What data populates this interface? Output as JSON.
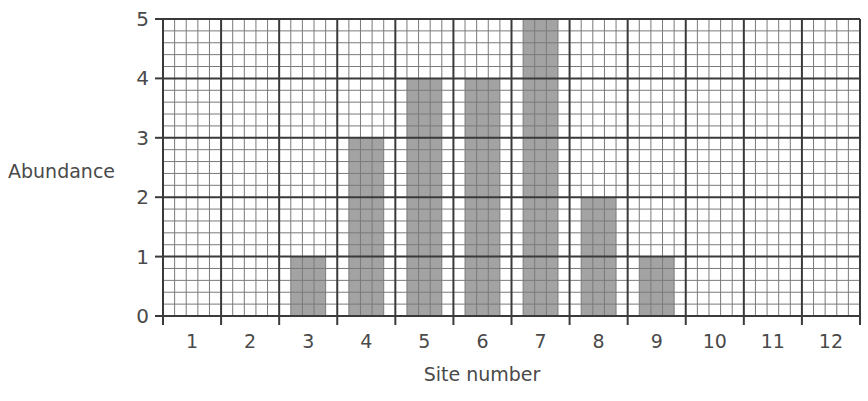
{
  "chart_data": {
    "type": "bar",
    "title": "",
    "xlabel": "Site number",
    "ylabel": "Abundance",
    "categories": [
      "1",
      "2",
      "3",
      "4",
      "5",
      "6",
      "7",
      "8",
      "9",
      "10",
      "11",
      "12"
    ],
    "values": [
      0,
      0,
      1,
      3,
      4,
      4,
      5,
      2,
      1,
      0,
      0,
      0
    ],
    "ylim": [
      0,
      5
    ],
    "yticks": [
      0,
      1,
      2,
      3,
      4,
      5
    ],
    "grid": true,
    "minor_divisions": 5,
    "legend": null
  },
  "colors": {
    "bar": "#a3a3a3",
    "major_grid": "#3a3a3a",
    "minor_grid": "#7a7a7a",
    "text": "#4a4a4a",
    "background": "#ffffff"
  }
}
